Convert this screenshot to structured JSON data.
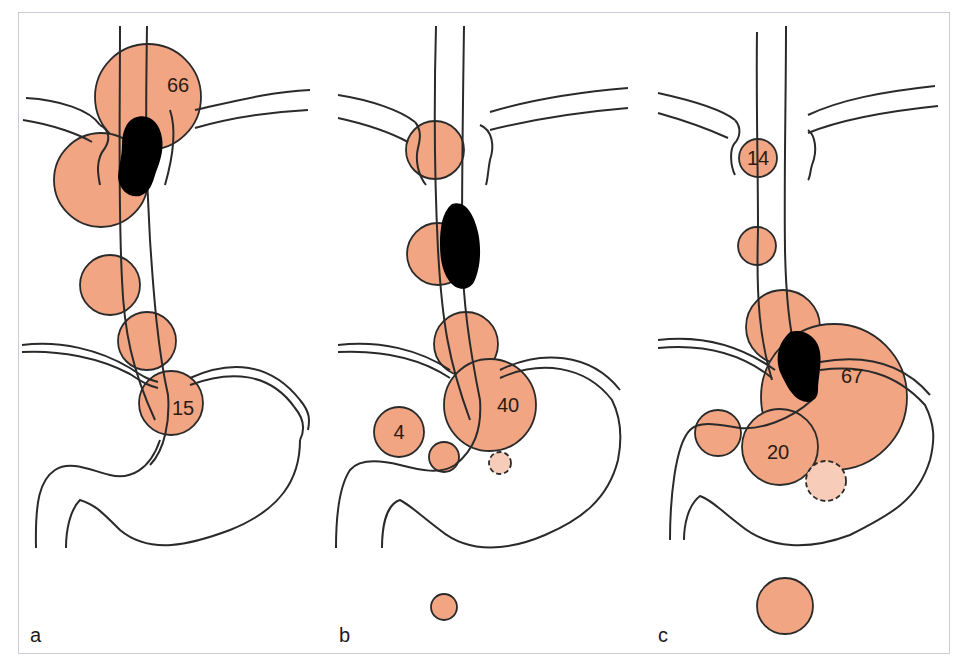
{
  "figure": {
    "colors": {
      "node_fill": "#f1a583",
      "node_fill_faint": "#f7cdb9",
      "outline": "#2a2a2a",
      "tumor": "#000000",
      "frame": "#c9ccd4"
    },
    "panels": [
      {
        "label": "a",
        "tumor_location": "upper thoracic / cervical",
        "nodes": [
          {
            "label": "66",
            "cx": 148,
            "cy": 97,
            "r": 53
          },
          {
            "label": "",
            "cx": 101,
            "cy": 180,
            "r": 47
          },
          {
            "label": "",
            "cx": 110,
            "cy": 285,
            "r": 30
          },
          {
            "label": "",
            "cx": 147,
            "cy": 341,
            "r": 29
          },
          {
            "label": "15",
            "cx": 171,
            "cy": 403,
            "r": 32
          }
        ]
      },
      {
        "label": "b",
        "tumor_location": "middle thoracic",
        "nodes": [
          {
            "label": "",
            "cx": 435,
            "cy": 150,
            "r": 29
          },
          {
            "label": "",
            "cx": 438,
            "cy": 254,
            "r": 31
          },
          {
            "label": "",
            "cx": 466,
            "cy": 344,
            "r": 32
          },
          {
            "label": "40",
            "cx": 490,
            "cy": 405,
            "r": 46
          },
          {
            "label": "4",
            "cx": 399,
            "cy": 432,
            "r": 25
          },
          {
            "label": "",
            "cx": 444,
            "cy": 457,
            "r": 15
          },
          {
            "label": "",
            "cx": 500,
            "cy": 463,
            "r": 11,
            "dashed": true
          },
          {
            "label": "",
            "cx": 444,
            "cy": 607,
            "r": 13
          }
        ]
      },
      {
        "label": "c",
        "tumor_location": "lower thoracic / cardia",
        "nodes": [
          {
            "label": "14",
            "cx": 758,
            "cy": 158,
            "r": 19
          },
          {
            "label": "",
            "cx": 757,
            "cy": 246,
            "r": 19
          },
          {
            "label": "",
            "cx": 783,
            "cy": 327,
            "r": 37
          },
          {
            "label": "67",
            "cx": 834,
            "cy": 397,
            "r": 73
          },
          {
            "label": "",
            "cx": 718,
            "cy": 433,
            "r": 23
          },
          {
            "label": "20",
            "cx": 780,
            "cy": 447,
            "r": 38
          },
          {
            "label": "",
            "cx": 826,
            "cy": 481,
            "r": 20,
            "dashed": true
          },
          {
            "label": "",
            "cx": 785,
            "cy": 606,
            "r": 28
          }
        ]
      }
    ]
  }
}
